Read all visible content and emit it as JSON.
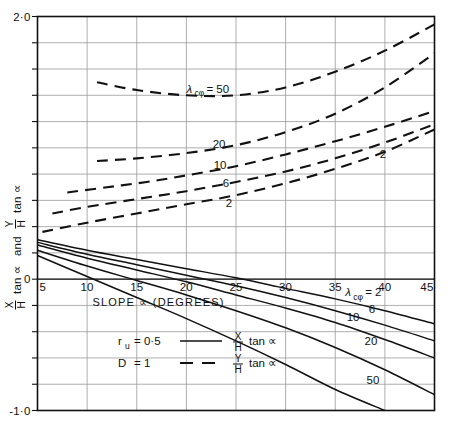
{
  "figure": {
    "background": "#ffffff",
    "ink": "#111111",
    "grid_color": "#9a9a9a",
    "frame_color": "#111111"
  },
  "chart_data": {
    "type": "line",
    "title": "",
    "subtitle": "",
    "xlabel": "SLOPE ∝ (DEGREES)",
    "ylabel": "X/H tan ∝  and  Y/H tan ∝",
    "xlim": [
      5,
      45
    ],
    "ylim": [
      -1.0,
      2.0
    ],
    "xticks": [
      5,
      10,
      15,
      20,
      25,
      30,
      35,
      40,
      45
    ],
    "xticklabels": [
      "5",
      "10",
      "15",
      "20",
      "25",
      "30",
      "35",
      "40",
      "45"
    ],
    "yticks": [
      2.0,
      0,
      -1.0
    ],
    "yticklabels": [
      "2·0",
      "0",
      "-1·0"
    ],
    "y_gridline_step": 0.2,
    "x_gridline_step": 5,
    "grid": true,
    "legend_position": "inside-bottom-center",
    "annotations": [
      {
        "text": "λ",
        "sub": "cφ",
        "suffix": "= 50",
        "x": 20.0,
        "y": 1.42,
        "series": "Y/H dashed, λ=50"
      },
      {
        "text": "20",
        "x": 23.3,
        "y": 1.0,
        "series": "Y/H dashed, λ=20"
      },
      {
        "text": "10",
        "x": 23.4,
        "y": 0.84,
        "series": "Y/H dashed, λ=10"
      },
      {
        "text": "6",
        "x": 24.0,
        "y": 0.7,
        "series": "Y/H dashed, λ=6"
      },
      {
        "text": "2",
        "x": 24.3,
        "y": 0.55,
        "series": "Y/H dashed, λ=2"
      },
      {
        "text": "2",
        "x": 39.8,
        "y": 0.92,
        "series": "Y/H dashed, λ=2 right end"
      },
      {
        "text": "λ",
        "sub": "cφ",
        "suffix": "= 2",
        "x": 36.0,
        "y": -0.13,
        "series": "X/H solid, λ=2"
      },
      {
        "text": "6",
        "x": 38.7,
        "y": -0.26,
        "series": "X/H solid, λ=6"
      },
      {
        "text": "10",
        "x": 36.8,
        "y": -0.32,
        "series": "X/H solid, λ=10"
      },
      {
        "text": "20",
        "x": 38.6,
        "y": -0.5,
        "series": "X/H solid, λ=20"
      },
      {
        "text": "50",
        "x": 38.8,
        "y": -0.8,
        "series": "X/H solid, λ=50"
      }
    ],
    "series": [
      {
        "name": "Y/H tan ∝, λ cφ = 50",
        "style": "dashed",
        "label": "50",
        "points": [
          [
            11.0,
            1.5
          ],
          [
            15.0,
            1.44
          ],
          [
            20.0,
            1.4
          ],
          [
            25.0,
            1.4
          ],
          [
            30.0,
            1.46
          ],
          [
            35.0,
            1.58
          ],
          [
            40.0,
            1.74
          ],
          [
            45.0,
            1.94
          ]
        ]
      },
      {
        "name": "Y/H tan ∝, λ cφ = 20",
        "style": "dashed",
        "label": "20",
        "points": [
          [
            11.0,
            0.9
          ],
          [
            15.0,
            0.92
          ],
          [
            20.0,
            0.96
          ],
          [
            25.0,
            1.02
          ],
          [
            30.0,
            1.12
          ],
          [
            35.0,
            1.26
          ],
          [
            40.0,
            1.46
          ],
          [
            45.0,
            1.72
          ]
        ]
      },
      {
        "name": "Y/H tan ∝, λ cφ = 10",
        "style": "dashed",
        "label": "10",
        "points": [
          [
            8.0,
            0.66
          ],
          [
            12.0,
            0.7
          ],
          [
            16.0,
            0.74
          ],
          [
            20.0,
            0.79
          ],
          [
            25.0,
            0.86
          ],
          [
            30.0,
            0.95
          ],
          [
            35.0,
            1.05
          ],
          [
            40.0,
            1.16
          ],
          [
            45.0,
            1.28
          ]
        ]
      },
      {
        "name": "Y/H tan ∝, λ cφ = 6",
        "style": "dashed",
        "label": "6",
        "points": [
          [
            6.5,
            0.5
          ],
          [
            10.0,
            0.55
          ],
          [
            15.0,
            0.61
          ],
          [
            20.0,
            0.67
          ],
          [
            25.0,
            0.74
          ],
          [
            30.0,
            0.82
          ],
          [
            35.0,
            0.92
          ],
          [
            40.0,
            1.04
          ],
          [
            45.0,
            1.18
          ]
        ]
      },
      {
        "name": "Y/H tan ∝, λ cφ = 2",
        "style": "dashed",
        "label": "2",
        "points": [
          [
            5.5,
            0.36
          ],
          [
            10.0,
            0.43
          ],
          [
            15.0,
            0.5
          ],
          [
            20.0,
            0.57
          ],
          [
            25.0,
            0.64
          ],
          [
            30.0,
            0.73
          ],
          [
            35.0,
            0.84
          ],
          [
            40.0,
            0.97
          ],
          [
            45.0,
            1.14
          ]
        ]
      },
      {
        "name": "X/H tan ∝, λ cφ = 2",
        "style": "solid",
        "label": "2",
        "points": [
          [
            5.0,
            0.3
          ],
          [
            10.0,
            0.22
          ],
          [
            15.0,
            0.15
          ],
          [
            20.0,
            0.08
          ],
          [
            25.0,
            0.01
          ],
          [
            30.0,
            -0.07
          ],
          [
            35.0,
            -0.15
          ],
          [
            40.0,
            -0.24
          ],
          [
            45.0,
            -0.34
          ]
        ]
      },
      {
        "name": "X/H tan ∝, λ cφ = 6",
        "style": "solid",
        "label": "6",
        "points": [
          [
            5.0,
            0.28
          ],
          [
            10.0,
            0.19
          ],
          [
            15.0,
            0.11
          ],
          [
            20.0,
            0.03
          ],
          [
            25.0,
            -0.05
          ],
          [
            30.0,
            -0.14
          ],
          [
            35.0,
            -0.24
          ],
          [
            40.0,
            -0.35
          ],
          [
            45.0,
            -0.47
          ]
        ]
      },
      {
        "name": "X/H tan ∝, λ cφ = 10",
        "style": "solid",
        "label": "10",
        "points": [
          [
            5.0,
            0.26
          ],
          [
            10.0,
            0.16
          ],
          [
            15.0,
            0.07
          ],
          [
            20.0,
            -0.02
          ],
          [
            25.0,
            -0.12
          ],
          [
            30.0,
            -0.22
          ],
          [
            35.0,
            -0.33
          ],
          [
            40.0,
            -0.46
          ],
          [
            45.0,
            -0.6
          ]
        ]
      },
      {
        "name": "X/H tan ∝, λ cφ = 20",
        "style": "solid",
        "label": "20",
        "points": [
          [
            5.0,
            0.22
          ],
          [
            10.0,
            0.1
          ],
          [
            15.0,
            -0.01
          ],
          [
            20.0,
            -0.12
          ],
          [
            25.0,
            -0.24
          ],
          [
            30.0,
            -0.37
          ],
          [
            35.0,
            -0.52
          ],
          [
            40.0,
            -0.69
          ],
          [
            45.0,
            -0.88
          ]
        ]
      },
      {
        "name": "X/H tan ∝, λ cφ = 50",
        "style": "solid",
        "label": "50",
        "points": [
          [
            5.0,
            0.18
          ],
          [
            10.0,
            0.02
          ],
          [
            15.0,
            -0.14
          ],
          [
            20.0,
            -0.3
          ],
          [
            25.0,
            -0.47
          ],
          [
            30.0,
            -0.65
          ],
          [
            35.0,
            -0.84
          ],
          [
            40.0,
            -1.0
          ]
        ]
      }
    ],
    "legend": {
      "entries": [
        {
          "condition": "r",
          "condition_sub": "u",
          "condition_value": "= 0·5",
          "style": "solid",
          "quantity_num": "X",
          "quantity_den": "H",
          "quantity_suffix": "tan ∝"
        },
        {
          "condition": "D",
          "condition_sub": "",
          "condition_value": "= 1",
          "style": "dashed",
          "quantity_num": "Y",
          "quantity_den": "H",
          "quantity_suffix": "tan ∝"
        }
      ]
    },
    "ylabel_parts": {
      "first_num": "X",
      "first_den": "H",
      "first_tan": "tan ∝",
      "connector": "and",
      "second_num": "Y",
      "second_den": "H",
      "second_tan": "tan ∝"
    }
  }
}
